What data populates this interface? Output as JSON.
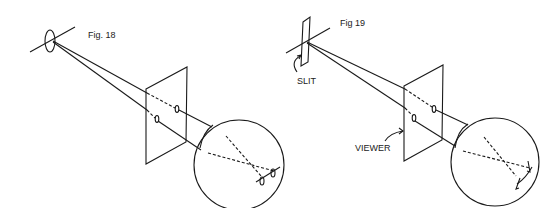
{
  "figures": [
    {
      "id": "fig18",
      "label": "Fig. 18",
      "description": "Point source (pinhole aperture) projecting rays through a viewer plate into an eye sphere"
    },
    {
      "id": "fig19",
      "label": "Fig 19",
      "description": "Slit source projecting rays through a viewer plate into an eye sphere",
      "annotations": {
        "slit": "SLIT",
        "viewer": "VIEWER"
      }
    }
  ],
  "colors": {
    "ink": "#1a1a1a",
    "background": "#ffffff"
  }
}
